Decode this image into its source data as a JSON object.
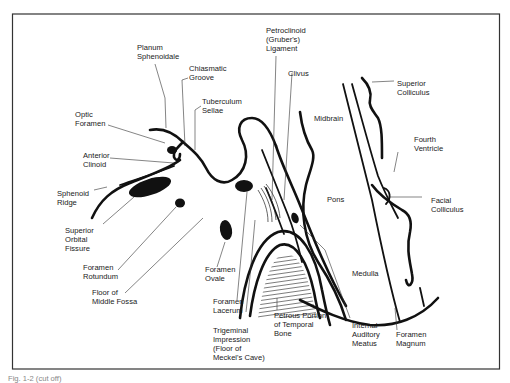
{
  "figure": {
    "type": "anatomical line drawing",
    "caption_partial": "Fig. 1-2 (cut off)"
  },
  "labels": {
    "planum_sphenoidale": [
      "Planum",
      "Sphenoidale"
    ],
    "chiasmatic_groove": [
      "Chiasmatic",
      "Groove"
    ],
    "tuberculum_sellae": [
      "Tuberculum",
      "Sellae"
    ],
    "optic_foramen": [
      "Optic",
      "Foramen"
    ],
    "anterior_clinoid": [
      "Anterior",
      "Clinoid"
    ],
    "sphenoid_ridge": [
      "Sphenoid",
      "Ridge"
    ],
    "superior_orbital_fissure": [
      "Superior",
      "Orbital",
      "Fissure"
    ],
    "foramen_rotundum": [
      "Foramen",
      "Rotundum"
    ],
    "floor_middle_fossa": [
      "Floor of",
      "Middle Fossa"
    ],
    "foramen_ovale": [
      "Foramen",
      "Ovale"
    ],
    "foramen_lacerum": [
      "Foramen",
      "Lacerum"
    ],
    "trigeminal_impression": [
      "Trigeminal",
      "Impression",
      "(Floor of",
      "Meckel's Cave)"
    ],
    "petroclinoid_ligament": [
      "Petroclinoid",
      "(Gruber's)",
      "Ligament"
    ],
    "clivus": [
      "Clivus"
    ],
    "midbrain": [
      "Midbrain"
    ],
    "pons": [
      "Pons"
    ],
    "medulla": [
      "Medulla"
    ],
    "superior_colliculus": [
      "Superior",
      "Colliculus"
    ],
    "fourth_ventricle": [
      "Fourth",
      "Ventricle"
    ],
    "facial_colliculus": [
      "Facial",
      "Colliculus"
    ],
    "petrous_portion": [
      "Petrous Portion",
      "of Temporal",
      "Bone"
    ],
    "internal_auditory_meatus": [
      "Internal",
      "Auditory",
      "Meatus"
    ],
    "foramen_magnum": [
      "Foramen",
      "Magnum"
    ]
  },
  "colors": {
    "ink": "#111111",
    "background": "#ffffff",
    "frame": "#333333"
  }
}
